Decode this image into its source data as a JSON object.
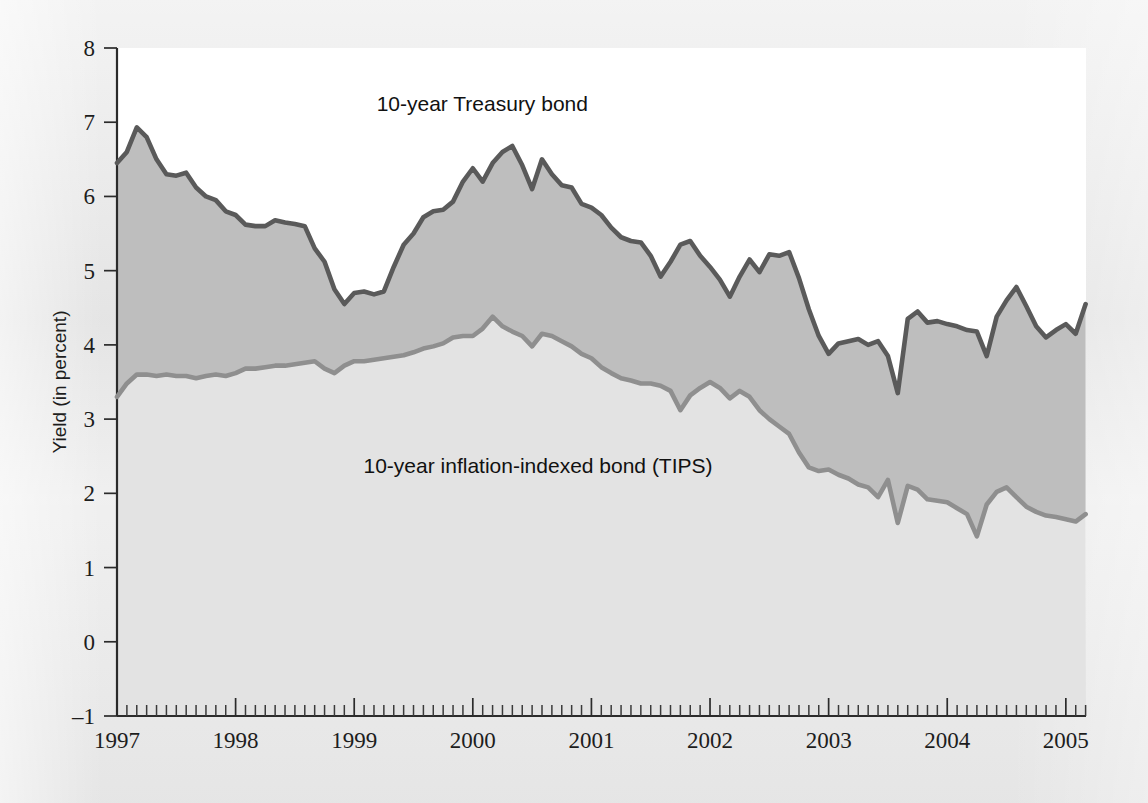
{
  "chart_data": {
    "type": "line",
    "title": "",
    "xlabel": "",
    "ylabel": "Yield (in percent)",
    "ylim": [
      -1,
      8
    ],
    "xlim": [
      1997.0,
      2005.17
    ],
    "yticks": [
      -1,
      0,
      1,
      2,
      3,
      4,
      5,
      6,
      7,
      8
    ],
    "ytick_labels": [
      "–1",
      "0",
      "1",
      "2",
      "3",
      "4",
      "5",
      "6",
      "7",
      "8"
    ],
    "xticks": [
      1997,
      1998,
      1999,
      2000,
      2001,
      2002,
      2003,
      2004,
      2005
    ],
    "xtick_labels": [
      "1997",
      "1998",
      "1999",
      "2000",
      "2001",
      "2002",
      "2003",
      "2004",
      "2005"
    ],
    "x_minor_tick_interval_months": 1,
    "grid": false,
    "legend_position": "inline-annotations",
    "annotations": [
      {
        "text": "10-year Treasury bond",
        "x": 2000.08,
        "y": 7.15
      },
      {
        "text": "10-year inflation-indexed bond (TIPS)",
        "x": 2000.55,
        "y": 2.28
      }
    ],
    "fill_between_series": [
      "10-year Treasury bond",
      "10-year inflation-indexed bond (TIPS)"
    ],
    "fill_color": "#b9b9b9",
    "x": [
      1997.0,
      1997.083,
      1997.167,
      1997.25,
      1997.333,
      1997.417,
      1997.5,
      1997.583,
      1997.667,
      1997.75,
      1997.833,
      1997.917,
      1998.0,
      1998.083,
      1998.167,
      1998.25,
      1998.333,
      1998.417,
      1998.5,
      1998.583,
      1998.667,
      1998.75,
      1998.833,
      1998.917,
      1999.0,
      1999.083,
      1999.167,
      1999.25,
      1999.333,
      1999.417,
      1999.5,
      1999.583,
      1999.667,
      1999.75,
      1999.833,
      1999.917,
      2000.0,
      2000.083,
      2000.167,
      2000.25,
      2000.333,
      2000.417,
      2000.5,
      2000.583,
      2000.667,
      2000.75,
      2000.833,
      2000.917,
      2001.0,
      2001.083,
      2001.167,
      2001.25,
      2001.333,
      2001.417,
      2001.5,
      2001.583,
      2001.667,
      2001.75,
      2001.833,
      2001.917,
      2002.0,
      2002.083,
      2002.167,
      2002.25,
      2002.333,
      2002.417,
      2002.5,
      2002.583,
      2002.667,
      2002.75,
      2002.833,
      2002.917,
      2003.0,
      2003.083,
      2003.167,
      2003.25,
      2003.333,
      2003.417,
      2003.5,
      2003.583,
      2003.667,
      2003.75,
      2003.833,
      2003.917,
      2004.0,
      2004.083,
      2004.167,
      2004.25,
      2004.333,
      2004.417,
      2004.5,
      2004.583,
      2004.667,
      2004.75,
      2004.833,
      2004.917,
      2005.0,
      2005.083,
      2005.167
    ],
    "series": [
      {
        "name": "10-year Treasury bond",
        "color": "#5a5a5a",
        "values": [
          6.45,
          6.6,
          6.93,
          6.8,
          6.5,
          6.3,
          6.28,
          6.32,
          6.12,
          6.0,
          5.95,
          5.8,
          5.75,
          5.62,
          5.6,
          5.6,
          5.68,
          5.65,
          5.63,
          5.6,
          5.3,
          5.12,
          4.75,
          4.55,
          4.7,
          4.72,
          4.68,
          4.72,
          5.05,
          5.35,
          5.5,
          5.72,
          5.8,
          5.82,
          5.93,
          6.2,
          6.38,
          6.2,
          6.45,
          6.6,
          6.68,
          6.42,
          6.1,
          6.5,
          6.3,
          6.15,
          6.12,
          5.9,
          5.85,
          5.75,
          5.58,
          5.45,
          5.4,
          5.38,
          5.2,
          4.92,
          5.12,
          5.35,
          5.4,
          5.2,
          5.05,
          4.88,
          4.65,
          4.92,
          5.15,
          4.98,
          5.22,
          5.2,
          5.25,
          4.9,
          4.48,
          4.12,
          3.88,
          4.02,
          4.05,
          4.08,
          4.0,
          4.05,
          3.85,
          3.35,
          4.35,
          4.45,
          4.3,
          4.32,
          4.28,
          4.25,
          4.2,
          4.18,
          3.85,
          4.38,
          4.6,
          4.78,
          4.52,
          4.25,
          4.1,
          4.2,
          4.28,
          4.15,
          4.55
        ]
      },
      {
        "name": "10-year inflation-indexed bond (TIPS)",
        "color": "#8f8f8f",
        "values": [
          3.3,
          3.48,
          3.6,
          3.6,
          3.58,
          3.6,
          3.58,
          3.58,
          3.55,
          3.58,
          3.6,
          3.58,
          3.62,
          3.68,
          3.68,
          3.7,
          3.72,
          3.72,
          3.74,
          3.76,
          3.78,
          3.68,
          3.62,
          3.72,
          3.78,
          3.78,
          3.8,
          3.82,
          3.84,
          3.86,
          3.9,
          3.95,
          3.98,
          4.02,
          4.1,
          4.12,
          4.12,
          4.22,
          4.38,
          4.25,
          4.18,
          4.12,
          3.98,
          4.15,
          4.12,
          4.05,
          3.98,
          3.88,
          3.82,
          3.7,
          3.62,
          3.55,
          3.52,
          3.48,
          3.48,
          3.45,
          3.38,
          3.12,
          3.32,
          3.42,
          3.5,
          3.42,
          3.28,
          3.38,
          3.3,
          3.12,
          3.0,
          2.9,
          2.8,
          2.55,
          2.35,
          2.3,
          2.32,
          2.25,
          2.2,
          2.12,
          2.08,
          1.95,
          2.18,
          1.6,
          2.1,
          2.05,
          1.92,
          1.9,
          1.88,
          1.8,
          1.72,
          1.42,
          1.85,
          2.02,
          2.08,
          1.95,
          1.82,
          1.75,
          1.7,
          1.68,
          1.65,
          1.62,
          1.72
        ]
      }
    ]
  }
}
